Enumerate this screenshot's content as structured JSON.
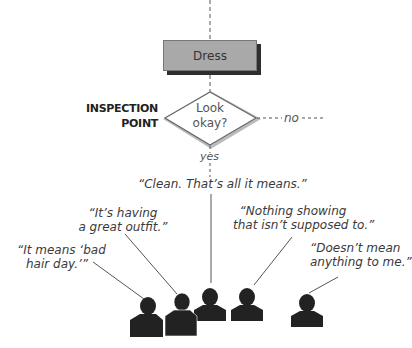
{
  "diagram": {
    "process_box": {
      "label": "Dress"
    },
    "decision": {
      "side_label_line1": "INSPECTION",
      "side_label_line2": "POINT",
      "question_line1": "Look",
      "question_line2": "okay?",
      "no_branch": "no",
      "yes_branch": "yes"
    },
    "quotes": [
      {
        "id": "clean",
        "lines": [
          "“Clean. That’s all it means.”"
        ]
      },
      {
        "id": "great-outfit",
        "lines": [
          "“It’s having",
          "a great outfit.”"
        ]
      },
      {
        "id": "bad-hair-day",
        "lines": [
          "“It means ‘bad",
          "hair day.’”"
        ]
      },
      {
        "id": "nothing-showing",
        "lines": [
          "“Nothing showing",
          "that isn’t supposed to.”"
        ]
      },
      {
        "id": "doesnt-mean",
        "lines": [
          "“Doesn’t mean",
          "anything to me.”"
        ]
      }
    ],
    "people_count": 5,
    "colors": {
      "box_fill": "#a9a9a9",
      "box_shadow": "#2e2e2e",
      "silhouette": "#222222",
      "line": "#555555"
    }
  }
}
